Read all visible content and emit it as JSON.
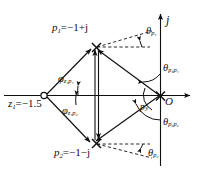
{
  "figure": {
    "type": "pole-zero-plot",
    "axes": {
      "imaginary_label": "j",
      "real_axis": "horizontal",
      "origin_label": "O"
    },
    "colors": {
      "background": "#ffffff",
      "ink": "#101010",
      "dashed": "#101010"
    },
    "poles": [
      {
        "id": "p1",
        "label_prefix": "p",
        "label_sub": "1",
        "value": "=−1+j",
        "x": -1,
        "y": 1,
        "marker": "x"
      },
      {
        "id": "p2",
        "label_prefix": "p",
        "label_sub": "2",
        "value": "=−1−j",
        "x": -1,
        "y": -1,
        "marker": "x"
      },
      {
        "id": "p3",
        "label_prefix": "p",
        "label_sub": "3",
        "value": "",
        "x": 0,
        "y": 0,
        "marker": "x"
      }
    ],
    "zeros": [
      {
        "id": "z1",
        "label_prefix": "z",
        "label_sub": "1",
        "value": "=−1.5",
        "x": -1.5,
        "y": 0,
        "marker": "o"
      }
    ],
    "labels": {
      "p1": "p",
      "p1_sub": "1",
      "p1_val": "=−1+j",
      "p2": "p",
      "p2_sub": "2",
      "p2_val": "=−1−j",
      "p3": "p",
      "p3_sub": "3",
      "z1": "z",
      "z1_sub": "1",
      "z1_val": "=−1.5",
      "origin": "O",
      "axis_j": "j"
    },
    "angles": [
      {
        "id": "theta_p1",
        "sym": "θ",
        "sub": "p₁",
        "sub_plain": "p1",
        "at": "p1",
        "desc": "angle of vector to p1 from real-axis direction"
      },
      {
        "id": "theta_p2",
        "sym": "θ",
        "sub": "p₂",
        "sub_plain": "p2",
        "at": "p2",
        "desc": "angle of vector to p2 from real-axis direction"
      },
      {
        "id": "phi_z1p1",
        "sym": "φ",
        "sub": "z₁p₁",
        "sub_plain": "z1p1",
        "at": "z1",
        "desc": "angle from zero z1 to pole p1"
      },
      {
        "id": "phi_z1p2",
        "sym": "φ",
        "sub": "z₁p₂",
        "sub_plain": "z1p2",
        "at": "z1",
        "desc": "angle from zero z1 to pole p2"
      },
      {
        "id": "theta_p3p1",
        "sym": "θ",
        "sub": "p₃p₁",
        "sub_plain": "p3p1",
        "at": "p3",
        "desc": "angle at p3 toward p1"
      },
      {
        "id": "theta_p3p2",
        "sym": "θ",
        "sub": "p₃p₂",
        "sub_plain": "p3p2",
        "at": "p3",
        "desc": "angle at p3 toward p2"
      }
    ]
  }
}
